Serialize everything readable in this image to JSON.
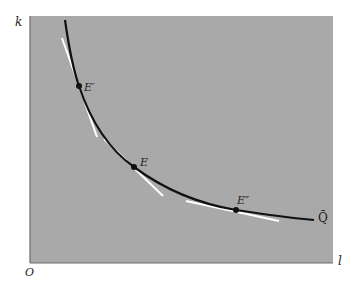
{
  "diagram": {
    "axes": {
      "y_label": "k",
      "x_label": "l",
      "origin_label": "O"
    },
    "curve": {
      "label": "Q̄",
      "color": "#111111"
    },
    "points": [
      {
        "name": "E'",
        "label": "E′",
        "x": 79,
        "y": 86
      },
      {
        "name": "E",
        "label": "E",
        "x": 134,
        "y": 167
      },
      {
        "name": "E''",
        "label": "E″",
        "x": 236,
        "y": 210
      }
    ],
    "colors": {
      "plot_background": "#a9a9a9",
      "tangent_lines": "#ffffff",
      "axis": "#555555"
    }
  }
}
